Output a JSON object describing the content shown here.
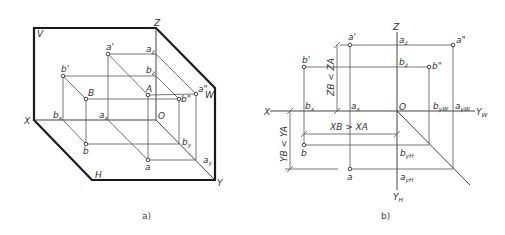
{
  "figure_a": {
    "caption": "a)",
    "planes": {
      "V": "V",
      "H": "H",
      "W": "W"
    },
    "axes": {
      "X": "X",
      "Y": "Y",
      "Z": "Z",
      "O": "O"
    },
    "points": {
      "a_prime": "a'",
      "b_prime": "b'",
      "A": "A",
      "B": "B",
      "a": "a",
      "b": "b",
      "a_dprime": "a\"",
      "b_dprime": "b\"",
      "ax": "a",
      "bx": "b",
      "az": "a",
      "bz": "b",
      "ay": "a",
      "by": "b"
    },
    "subscripts": {
      "x": "x",
      "y": "y",
      "z": "z"
    }
  },
  "figure_b": {
    "caption": "b)",
    "axes": {
      "X": "X",
      "Z": "Z",
      "O": "O",
      "YW": "Y",
      "YW_sub": "W",
      "YH": "Y",
      "YH_sub": "H"
    },
    "points": {
      "a_prime": "a'",
      "b_prime": "b'",
      "a_dprime": "a\"",
      "b_dprime": "b\"",
      "a": "a",
      "b": "b",
      "ax": "a",
      "bx": "b",
      "az": "a",
      "bz": "b",
      "ayw": "a",
      "byw": "b",
      "ayh": "a",
      "byh": "b"
    },
    "dimensions": {
      "z_compare": "ZB < ZA",
      "x_compare": "XB > XA",
      "y_compare": "YB < YA"
    }
  }
}
